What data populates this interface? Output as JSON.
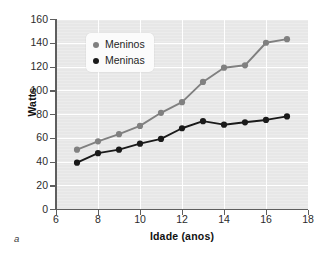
{
  "panel_label": "a",
  "legend": {
    "position": "top-left-inside",
    "entries": [
      {
        "label": "Meninos",
        "color": "#808080"
      },
      {
        "label": "Meninas",
        "color": "#1a1a1a"
      }
    ]
  },
  "chart_data": {
    "type": "line",
    "title": "",
    "subtitle": "",
    "xlabel": "Idade (anos)",
    "ylabel": "Watts",
    "xlim": [
      6,
      18
    ],
    "ylim": [
      0,
      160
    ],
    "xticks": [
      6,
      8,
      10,
      12,
      14,
      16,
      18
    ],
    "yticks": [
      0,
      20,
      40,
      60,
      80,
      100,
      120,
      140,
      160
    ],
    "xtick_labels": [
      "6",
      "8",
      "10",
      "12",
      "14",
      "16",
      "18"
    ],
    "ytick_labels": [
      "0",
      "20",
      "40",
      "60",
      "80",
      "100",
      "120",
      "140",
      "160"
    ],
    "grid": true,
    "grid_color": "#ffffff",
    "plot_background": "#e7e7e7",
    "x": [
      7,
      8,
      9,
      10,
      11,
      12,
      13,
      14,
      15,
      16,
      17
    ],
    "series": [
      {
        "name": "Meninos",
        "color": "#808080",
        "marker": "circle",
        "values": [
          50,
          57,
          63,
          70,
          81,
          90,
          107,
          119,
          121,
          140,
          143
        ]
      },
      {
        "name": "Meninas",
        "color": "#1a1a1a",
        "marker": "circle",
        "values": [
          39,
          47,
          50,
          55,
          59,
          68,
          74,
          71,
          73,
          75,
          78
        ]
      }
    ],
    "annotations": []
  }
}
